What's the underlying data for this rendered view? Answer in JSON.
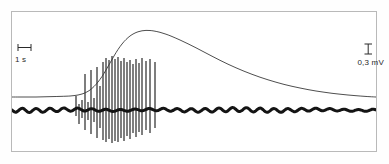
{
  "figure": {
    "kind": "electrophysiology-recording",
    "caption": "",
    "background_color": "#ffffff",
    "frame_color": "#b9b9b9",
    "trace_color": "#1a1a1a",
    "curve_color": "#3a3a3a"
  },
  "scalebars": {
    "time": {
      "icon": "horizontal-scalebar-icon",
      "label": "1 s",
      "orientation": "horizontal",
      "length_px": 12
    },
    "amplitude": {
      "icon": "vertical-scalebar-icon",
      "label": "0,3 mV",
      "orientation": "vertical",
      "length_px": 11
    }
  },
  "chart_data": {
    "type": "line",
    "title": "",
    "xlabel": "",
    "ylabel": "",
    "grid": false,
    "legend": "none",
    "axis_visible": false,
    "xlim": [
      0,
      366
    ],
    "ylim": [
      0,
      141
    ],
    "series": [
      {
        "name": "slow-potential-curve",
        "role": "smooth slow depolarizing potential",
        "color": "#3a3a3a",
        "width": 0.9,
        "points": [
          [
            0,
            85
          ],
          [
            8,
            85
          ],
          [
            16,
            85
          ],
          [
            24,
            85
          ],
          [
            32,
            84.8
          ],
          [
            40,
            84.6
          ],
          [
            48,
            84.4
          ],
          [
            54,
            84.2
          ],
          [
            58,
            84.0
          ],
          [
            62,
            83.6
          ],
          [
            66,
            83.0
          ],
          [
            70,
            82.0
          ],
          [
            74,
            80.4
          ],
          [
            78,
            78.0
          ],
          [
            82,
            74.5
          ],
          [
            86,
            70.0
          ],
          [
            90,
            64.5
          ],
          [
            94,
            58.0
          ],
          [
            98,
            51.0
          ],
          [
            102,
            44.0
          ],
          [
            106,
            37.5
          ],
          [
            110,
            32.0
          ],
          [
            114,
            27.5
          ],
          [
            118,
            24.0
          ],
          [
            122,
            21.5
          ],
          [
            126,
            19.8
          ],
          [
            130,
            18.8
          ],
          [
            134,
            18.4
          ],
          [
            138,
            18.5
          ],
          [
            142,
            19.0
          ],
          [
            148,
            20.3
          ],
          [
            154,
            22.2
          ],
          [
            160,
            24.5
          ],
          [
            168,
            28.0
          ],
          [
            176,
            31.8
          ],
          [
            184,
            35.8
          ],
          [
            192,
            40.0
          ],
          [
            200,
            44.2
          ],
          [
            208,
            48.3
          ],
          [
            216,
            52.2
          ],
          [
            224,
            55.8
          ],
          [
            232,
            59.2
          ],
          [
            240,
            62.3
          ],
          [
            248,
            65.2
          ],
          [
            256,
            67.8
          ],
          [
            264,
            70.2
          ],
          [
            272,
            72.4
          ],
          [
            280,
            74.3
          ],
          [
            288,
            76.0
          ],
          [
            296,
            77.6
          ],
          [
            304,
            79.0
          ],
          [
            312,
            80.2
          ],
          [
            320,
            81.3
          ],
          [
            328,
            82.2
          ],
          [
            336,
            83.0
          ],
          [
            344,
            83.7
          ],
          [
            352,
            84.3
          ],
          [
            358,
            84.7
          ],
          [
            364,
            85.0
          ],
          [
            366,
            85.1
          ]
        ]
      },
      {
        "name": "emg-baseline",
        "role": "electromyogram baseline band",
        "color": "#141414",
        "width": 3.0,
        "baseline_y": 98,
        "ripple_amplitude": 1.5,
        "ripple_period": 7
      }
    ],
    "spikes": {
      "name": "action-potential-burst",
      "role": "burst of action potentials",
      "color": "#141414",
      "width": 1.1,
      "baseline_y": 98,
      "events": [
        {
          "x": 64,
          "up": 84,
          "down": 104
        },
        {
          "x": 67,
          "up": 92,
          "down": 112
        },
        {
          "x": 70,
          "up": 88,
          "down": 106
        },
        {
          "x": 73,
          "up": 62,
          "down": 118
        },
        {
          "x": 76,
          "up": 90,
          "down": 108
        },
        {
          "x": 79,
          "up": 58,
          "down": 122
        },
        {
          "x": 82,
          "up": 86,
          "down": 110
        },
        {
          "x": 85,
          "up": 55,
          "down": 126
        },
        {
          "x": 88,
          "up": 74,
          "down": 116
        },
        {
          "x": 91,
          "up": 50,
          "down": 128
        },
        {
          "x": 94,
          "up": 46,
          "down": 130
        },
        {
          "x": 97,
          "up": 48,
          "down": 127
        },
        {
          "x": 100,
          "up": 44,
          "down": 131
        },
        {
          "x": 103,
          "up": 47,
          "down": 129
        },
        {
          "x": 106,
          "up": 45,
          "down": 130
        },
        {
          "x": 109,
          "up": 49,
          "down": 126
        },
        {
          "x": 112,
          "up": 46,
          "down": 129
        },
        {
          "x": 115,
          "up": 50,
          "down": 124
        },
        {
          "x": 118,
          "up": 48,
          "down": 127
        },
        {
          "x": 121,
          "up": 52,
          "down": 121
        },
        {
          "x": 124,
          "up": 47,
          "down": 125
        },
        {
          "x": 127,
          "up": 51,
          "down": 120
        },
        {
          "x": 130,
          "up": 46,
          "down": 123
        },
        {
          "x": 134,
          "up": 49,
          "down": 118
        },
        {
          "x": 138,
          "up": 47,
          "down": 121
        },
        {
          "x": 143,
          "up": 50,
          "down": 116
        }
      ]
    },
    "annotations": [
      {
        "name": "time-scalebar",
        "text": "1 s",
        "x": 4,
        "y": 38
      },
      {
        "name": "amplitude-scalebar",
        "text": "0,3 mV",
        "x": 336,
        "y": 38
      }
    ]
  }
}
